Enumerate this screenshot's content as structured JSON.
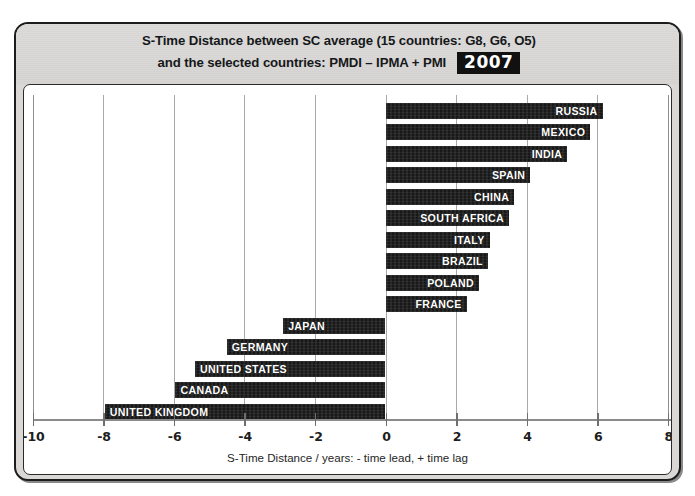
{
  "header": {
    "title_line_1": "S-Time Distance between SC average (15 countries: G8, G6, O5)",
    "title_line_2": "and the selected countries: PMDI – IPMA + PMI",
    "year_badge": "2007"
  },
  "chart_data": {
    "type": "bar",
    "orientation": "horizontal",
    "title": "S-Time Distance between SC average (15 countries: G8, G6, O5) and the selected countries: PMDI – IPMA + PMI",
    "year": "2007",
    "xlabel": "S-Time Distance / years: - time lead, + time lag",
    "ylabel": "",
    "xlim": [
      -10,
      8
    ],
    "xticks": [
      -10,
      -8,
      -6,
      -4,
      -2,
      0,
      2,
      4,
      6,
      8
    ],
    "xtick_labels": [
      "-10",
      "-8",
      "-6",
      "-4",
      "-2",
      "0",
      "2",
      "4",
      "6",
      "8"
    ],
    "grid": true,
    "grid_axis": "x",
    "legend": false,
    "bar_color": "#1b1b1b",
    "label_color": "#ffffff",
    "categories": [
      "RUSSIA",
      "MEXICO",
      "INDIA",
      "SPAIN",
      "CHINA",
      "SOUTH AFRICA",
      "ITALY",
      "BRAZIL",
      "POLAND",
      "FRANCE",
      "JAPAN",
      "GERMANY",
      "UNITED STATES",
      "CANADA",
      "UNITED KINGDOM"
    ],
    "values": [
      6.15,
      5.8,
      5.15,
      4.1,
      3.65,
      3.5,
      2.95,
      2.9,
      2.65,
      2.3,
      -2.9,
      -4.5,
      -5.4,
      -5.95,
      -7.95
    ]
  },
  "axis_caption": "S-Time Distance / years: - time lead, + time lag"
}
